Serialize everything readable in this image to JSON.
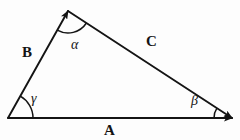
{
  "figure": {
    "kind": "vector-triangle-diagram",
    "background_color": "#fdfdfd",
    "ink_color": "#141414",
    "width": 240,
    "height": 140
  },
  "vectors": [
    {
      "id": "A",
      "label": "A",
      "name": "vector-a",
      "description": "base vector pointing right",
      "from": [
        8,
        118
      ],
      "to": [
        232,
        118
      ],
      "arrow_at": "to",
      "label_pos": [
        104,
        123
      ]
    },
    {
      "id": "B",
      "label": "B",
      "name": "vector-b",
      "description": "left side vector pointing up-right to apex",
      "from": [
        8,
        118
      ],
      "to": [
        68,
        11
      ],
      "arrow_at": "to",
      "label_pos": [
        22,
        45
      ]
    },
    {
      "id": "C",
      "label": "C",
      "name": "vector-c",
      "description": "upper right side vector pointing down-right",
      "from": [
        68,
        11
      ],
      "to": [
        232,
        118
      ],
      "arrow_at": "to",
      "label_pos": [
        146,
        34
      ]
    }
  ],
  "angles": [
    {
      "id": "alpha",
      "label": "α",
      "name": "angle-alpha",
      "vertex": [
        68,
        11
      ],
      "radius": 22,
      "label_pos": [
        71,
        38
      ]
    },
    {
      "id": "beta",
      "label": "β",
      "name": "angle-beta",
      "vertex": [
        232,
        118
      ],
      "radius": 18,
      "label_pos": [
        191,
        94
      ]
    },
    {
      "id": "gamma",
      "label": "γ",
      "name": "angle-gamma",
      "vertex": [
        8,
        118
      ],
      "radius": 25,
      "label_pos": [
        31,
        92
      ]
    }
  ]
}
